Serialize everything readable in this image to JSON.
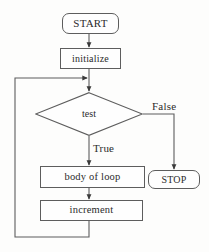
{
  "diagram": {
    "type": "flowchart",
    "background_color": "#fdfdfc",
    "stroke_color": "#5d5d5d",
    "text_color": "#2b2b2b",
    "nodes": [
      {
        "id": "start",
        "label": "START",
        "shape": "terminal-rounded-rect"
      },
      {
        "id": "initialize",
        "label": "initialize",
        "shape": "rect"
      },
      {
        "id": "test",
        "label": "test",
        "shape": "diamond"
      },
      {
        "id": "body",
        "label": "body of loop",
        "shape": "rect"
      },
      {
        "id": "increment",
        "label": "increment",
        "shape": "rect"
      },
      {
        "id": "stop",
        "label": "STOP",
        "shape": "terminal-rounded-rect"
      }
    ],
    "edges": [
      {
        "from": "start",
        "to": "initialize",
        "label": ""
      },
      {
        "from": "initialize",
        "to": "test",
        "label": ""
      },
      {
        "from": "test",
        "to": "stop",
        "label": "False"
      },
      {
        "from": "test",
        "to": "body",
        "label": "True"
      },
      {
        "from": "body",
        "to": "increment",
        "label": ""
      },
      {
        "from": "increment",
        "to": "test",
        "label": ""
      }
    ],
    "edge_labels": {
      "false_branch": "False",
      "true_branch": "True"
    }
  }
}
